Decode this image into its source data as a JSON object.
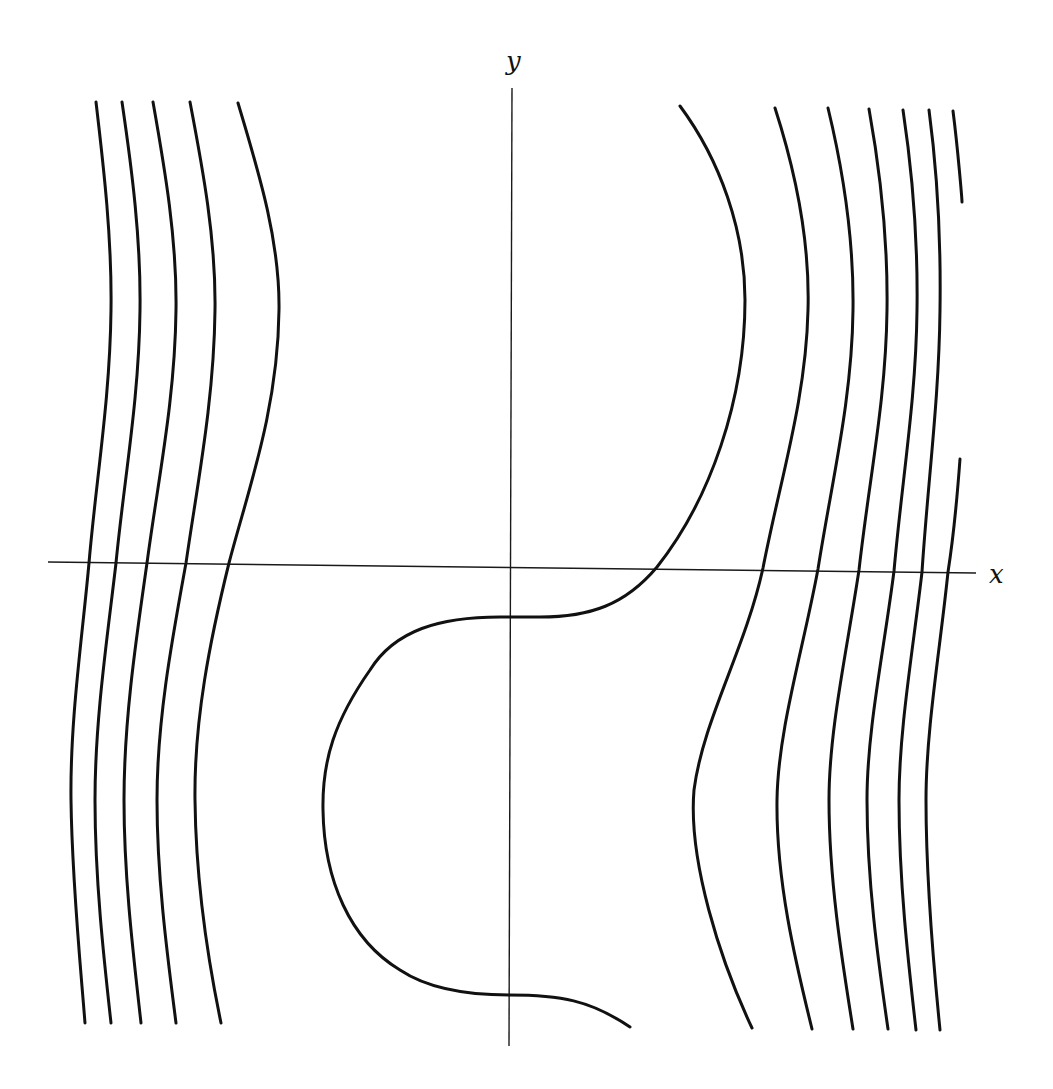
{
  "diagram": {
    "type": "phase-portrait / level curves",
    "axes": {
      "x_label": "x",
      "y_label": "y",
      "color": "#1a1a1a"
    },
    "curve_color": "#111111",
    "background": "#ffffff",
    "curve_groups": {
      "left_family": {
        "count": 5,
        "description": "nearly vertical curves bowing right near top, shifting right across x-axis"
      },
      "center_curve": {
        "count": 1,
        "description": "S-shaped curve: from top-right bulge, crosses x-axis, flat step at y-axis, bulges left, flat step at bottom, ends lower right"
      },
      "right_family": {
        "count": 7,
        "description": "nearly vertical curves bowing right near top and left near bottom, plus short broken segments at far right"
      }
    }
  }
}
